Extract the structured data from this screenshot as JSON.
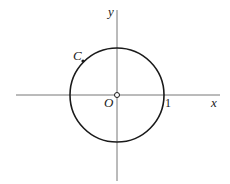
{
  "diagram": {
    "axes": {
      "x_label": "x",
      "y_label": "y"
    },
    "origin_label": "O",
    "tick_label": "1",
    "curve_label": "C",
    "colors": {
      "stroke": "#1a1a1a",
      "axis": "#777777"
    }
  }
}
